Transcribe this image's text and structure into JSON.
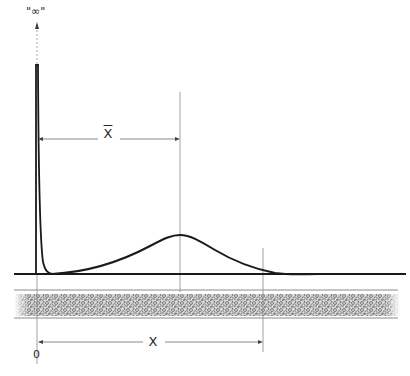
{
  "figure": {
    "labels": {
      "infinity": "\"∞\"",
      "mean_distance": "X",
      "distance": "X",
      "origin": "0"
    },
    "colors": {
      "ink": "#1a1a1a",
      "guide": "#8a8a8a",
      "packing": "#6b6b6b"
    },
    "elements": {
      "y_axis": {
        "x": 37,
        "top": 22,
        "bottom": 274
      },
      "baseline": {
        "y": 274,
        "x_start": 14,
        "x_end": 406
      },
      "injection_spike": {
        "x": 37,
        "peak_y": 65
      },
      "band_peak": {
        "x": 180,
        "y": 235
      },
      "mean_guide": {
        "x": 180,
        "top": 92,
        "bottom": 290
      },
      "front_guide": {
        "x": 263,
        "top": 248,
        "bottom": 350
      },
      "xbar_arrow": {
        "y": 139,
        "x_start": 37,
        "x_end": 180
      },
      "x_arrow": {
        "y": 342,
        "x_start": 37,
        "x_end": 263
      },
      "column_bed": {
        "top": 290,
        "bottom": 318,
        "x_start": 14,
        "x_end": 398
      }
    }
  }
}
